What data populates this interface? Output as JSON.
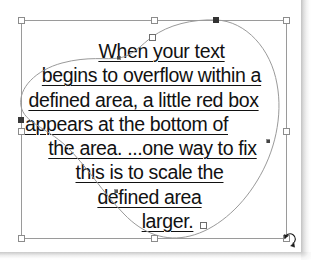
{
  "app": {
    "context": "vector-illustration-text-on-shape",
    "page_background": "#ffffff"
  },
  "artwork": {
    "text_block": {
      "alignment": "center",
      "underlined": true,
      "color": "#111111",
      "lines": [
        "When your text",
        "begins to overflow within a",
        "defined area, a little red box",
        "appears at the bottom of",
        "the area. ...one way to fix",
        "this is to scale the",
        "defined area",
        "larger."
      ],
      "full_text": "When your text begins to overflow within a defined area, a little red box appears at the bottom of the area. ...one way to fix this is to scale the defined area larger."
    },
    "shape_path": {
      "name": "blob-text-frame-path",
      "stroke_color": "#9a9a9a",
      "fill": "none",
      "anchor_points": [
        {
          "x": 216,
          "y": 20,
          "state": "selected"
        },
        {
          "x": 268,
          "y": 141,
          "state": "smooth"
        },
        {
          "x": 203,
          "y": 225,
          "state": "unselected"
        },
        {
          "x": 116,
          "y": 191,
          "state": "smooth"
        },
        {
          "x": 21,
          "y": 120,
          "state": "unselected"
        },
        {
          "x": 152,
          "y": 37,
          "state": "unselected"
        },
        {
          "x": 119,
          "y": 58,
          "state": "smooth"
        }
      ]
    },
    "selection_bbox": {
      "name": "transform-bounding-box",
      "stroke_color": "#9a9a9a",
      "handle_fill": "#ffffff",
      "handle_stroke": "#8c8c8c",
      "left": 21,
      "top": 20,
      "right": 286,
      "bottom": 238,
      "handles": [
        {
          "id": "handle-top-left",
          "x": 21,
          "y": 20
        },
        {
          "id": "handle-top-center",
          "x": 154,
          "y": 20
        },
        {
          "id": "handle-top-right",
          "x": 286,
          "y": 20
        },
        {
          "id": "handle-middle-left",
          "x": 21,
          "y": 131
        },
        {
          "id": "handle-middle-right",
          "x": 286,
          "y": 131
        },
        {
          "id": "handle-bottom-left",
          "x": 21,
          "y": 238
        },
        {
          "id": "handle-bottom-center",
          "x": 154,
          "y": 238
        },
        {
          "id": "handle-bottom-right",
          "x": 286,
          "y": 238
        }
      ]
    },
    "cursor": {
      "name": "rotate-cursor",
      "x": 289,
      "y": 240,
      "type": "rotate"
    }
  }
}
